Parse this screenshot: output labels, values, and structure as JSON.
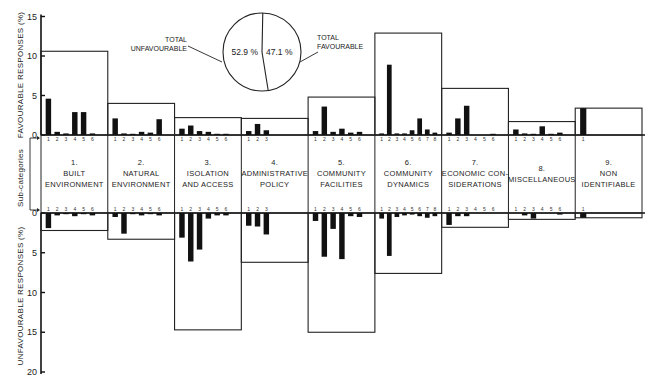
{
  "chart_data": {
    "type": "bar",
    "title": "",
    "layout": "mirrored bar chart: favourable responses above, unfavourable below, 9 categories with sub-category bars; category totals drawn as enclosing boxes; inset pie of total favourable vs unfavourable",
    "y_axis_top": {
      "label": "FAVOURABLE RESPONSES (%)",
      "ticks": [
        0,
        5,
        10,
        15
      ],
      "ylim": [
        0,
        15
      ]
    },
    "y_axis_bottom": {
      "label": "UNFAVOURABLE RESPONSES (%)",
      "ticks": [
        0,
        5,
        10,
        15,
        20
      ],
      "ylim": [
        0,
        20
      ],
      "inverted": true
    },
    "middle_axis_label": "Sub-categories",
    "categories": [
      {
        "num": "1.",
        "lines": [
          "BUILT",
          "ENVIRONMENT"
        ],
        "name": "Built Environment",
        "favourable_total": 10.6,
        "unfavourable_total": 2.2,
        "sub_fav": [
          4.6,
          0.4,
          0.2,
          2.9,
          2.9,
          0.2
        ],
        "sub_unfav": [
          1.9,
          0.3,
          0.1,
          0.4,
          0.1,
          0.3
        ]
      },
      {
        "num": "2.",
        "lines": [
          "NATURAL",
          "ENVIRONMENT"
        ],
        "name": "Natural Environment",
        "favourable_total": 4.0,
        "unfavourable_total": 3.3,
        "sub_fav": [
          2.1,
          0.2,
          0.1,
          0.4,
          0.3,
          2.0
        ],
        "sub_unfav": [
          0.5,
          2.6,
          0.1,
          0.3,
          0.1,
          0.3
        ]
      },
      {
        "num": "3.",
        "lines": [
          "ISOLATION",
          "AND ACCESS"
        ],
        "name": "Isolation and Access",
        "favourable_total": 2.2,
        "unfavourable_total": 14.7,
        "sub_fav": [
          0.8,
          1.2,
          0.5,
          0.4,
          0.1,
          0.1
        ],
        "sub_unfav": [
          3.1,
          6.1,
          4.6,
          0.7,
          0.3,
          0.3
        ]
      },
      {
        "num": "4.",
        "lines": [
          "ADMINISTRATIVE",
          "POLICY"
        ],
        "name": "Administrative Policy",
        "favourable_total": 2.1,
        "unfavourable_total": 6.2,
        "sub_fav": [
          0.5,
          1.4,
          0.6
        ],
        "sub_unfav": [
          1.6,
          1.7,
          2.7
        ]
      },
      {
        "num": "5.",
        "lines": [
          "COMMUNITY",
          "FACILITIES"
        ],
        "name": "Community Facilities",
        "favourable_total": 4.8,
        "unfavourable_total": 15.0,
        "sub_fav": [
          0.5,
          3.6,
          0.4,
          0.8,
          0.3,
          0.4
        ],
        "sub_unfav": [
          1.0,
          5.5,
          2.0,
          5.8,
          0.4,
          0.5
        ]
      },
      {
        "num": "6.",
        "lines": [
          "COMMUNITY",
          "DYNAMICS"
        ],
        "name": "Community Dynamics",
        "favourable_total": 12.9,
        "unfavourable_total": 7.6,
        "sub_fav": [
          0.2,
          8.9,
          0.2,
          0.2,
          0.6,
          2.1,
          0.7,
          0.3
        ],
        "sub_unfav": [
          0.7,
          5.4,
          0.5,
          0.3,
          0.2,
          0.4,
          0.6,
          0.4
        ]
      },
      {
        "num": "7.",
        "lines": [
          "ECONOMIC CON-",
          "SIDERATIONS"
        ],
        "name": "Economic Considerations",
        "favourable_total": 5.9,
        "unfavourable_total": 1.8,
        "sub_fav": [
          0.3,
          2.1,
          3.7,
          0.0,
          0.0,
          0.1
        ],
        "sub_unfav": [
          1.5,
          0.4,
          0.4,
          0.0,
          0.0,
          0.0
        ]
      },
      {
        "num": "8.",
        "lines": [
          "MISCELLANEOUS"
        ],
        "name": "Miscellaneous",
        "favourable_total": 1.7,
        "unfavourable_total": 0.8,
        "sub_fav": [
          0.7,
          0.2,
          0.1,
          1.1,
          0.1,
          0.3
        ],
        "sub_unfav": [
          0.0,
          0.3,
          0.7,
          0.0,
          0.0,
          0.2
        ]
      },
      {
        "num": "9.",
        "lines": [
          "NON",
          "IDENTIFIABLE"
        ],
        "name": "Non Identifiable",
        "favourable_total": 3.4,
        "unfavourable_total": 0.6,
        "sub_fav": [
          3.4
        ],
        "sub_unfav": [
          0.6
        ]
      }
    ],
    "pie": {
      "slices": [
        {
          "label": "TOTAL UNFAVOURABLE",
          "label_lines": [
            "TOTAL",
            "UNFAVOURABLE"
          ],
          "value": 52.9,
          "text": "52.9 %"
        },
        {
          "label": "TOTAL FAVOURABLE",
          "label_lines": [
            "TOTAL",
            "FAVOURABLE"
          ],
          "value": 47.1,
          "text": "47.1 %"
        }
      ]
    },
    "colors": {
      "bars": "#111111",
      "lines": "#222222",
      "background": "#ffffff"
    }
  }
}
